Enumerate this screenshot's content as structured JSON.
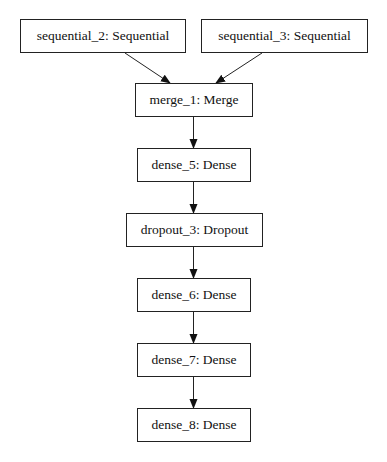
{
  "diagram": {
    "type": "model-graph",
    "nodes": [
      {
        "id": "sequential_2",
        "label": "sequential_2: Sequential",
        "x": 20,
        "y": 19,
        "w": 166,
        "h": 34
      },
      {
        "id": "sequential_3",
        "label": "sequential_3: Sequential",
        "x": 201,
        "y": 19,
        "w": 167,
        "h": 34
      },
      {
        "id": "merge_1",
        "label": "merge_1: Merge",
        "x": 135,
        "y": 83,
        "w": 118,
        "h": 34
      },
      {
        "id": "dense_5",
        "label": "dense_5: Dense",
        "x": 137,
        "y": 148,
        "w": 114,
        "h": 34
      },
      {
        "id": "dropout_3",
        "label": "dropout_3: Dropout",
        "x": 126,
        "y": 213,
        "w": 137,
        "h": 34
      },
      {
        "id": "dense_6",
        "label": "dense_6: Dense",
        "x": 137,
        "y": 278,
        "w": 114,
        "h": 34
      },
      {
        "id": "dense_7",
        "label": "dense_7: Dense",
        "x": 137,
        "y": 343,
        "w": 114,
        "h": 34
      },
      {
        "id": "dense_8",
        "label": "dense_8: Dense",
        "x": 137,
        "y": 408,
        "w": 114,
        "h": 34
      }
    ],
    "edges": [
      {
        "from": "sequential_2",
        "to": "merge_1"
      },
      {
        "from": "sequential_3",
        "to": "merge_1"
      },
      {
        "from": "merge_1",
        "to": "dense_5"
      },
      {
        "from": "dense_5",
        "to": "dropout_3"
      },
      {
        "from": "dropout_3",
        "to": "dense_6"
      },
      {
        "from": "dense_6",
        "to": "dense_7"
      },
      {
        "from": "dense_7",
        "to": "dense_8"
      }
    ],
    "colors": {
      "stroke": "#222222",
      "text": "#111111",
      "background": "#ffffff"
    }
  }
}
